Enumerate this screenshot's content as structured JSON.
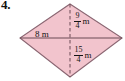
{
  "exercise": {
    "number": "4."
  },
  "figure": {
    "name": "kite-with-diagonals",
    "shape_type": "kite",
    "fill_color": "#f2c4cd",
    "stroke_color": "#8a6672",
    "background_color": "#ffffff",
    "vertices": {
      "top": {
        "x": 70,
        "y": 4
      },
      "right": {
        "x": 122,
        "y": 38
      },
      "bottom": {
        "x": 70,
        "y": 77
      },
      "left": {
        "x": 20,
        "y": 38
      }
    },
    "diagonals": {
      "horizontal": {
        "style": "solid",
        "from": "left",
        "to": "right"
      },
      "vertical": {
        "style": "dashed",
        "from": "top",
        "to": "bottom"
      }
    }
  },
  "labels": {
    "upper_height": {
      "numerator": "9",
      "denominator": "4",
      "unit": "m",
      "text": "9/4 m"
    },
    "lower_height": {
      "numerator": "15",
      "denominator": "4",
      "unit": "m",
      "text": "15/4 m"
    },
    "base": {
      "text": "8 m"
    }
  }
}
